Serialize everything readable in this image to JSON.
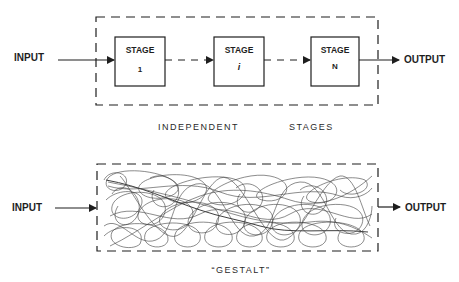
{
  "top_diagram": {
    "input_label": "INPUT",
    "output_label": "OUTPUT",
    "stages": [
      {
        "title": "STAGE",
        "index": "1"
      },
      {
        "title": "STAGE",
        "index": "i"
      },
      {
        "title": "STAGE",
        "index": "N"
      }
    ],
    "caption_left": "INDEPENDENT",
    "caption_right": "STAGES"
  },
  "bottom_diagram": {
    "input_label": "INPUT",
    "output_label": "OUTPUT",
    "caption": "“GESTALT”"
  },
  "colors": {
    "ink": "#1e1e1e",
    "background": "#ffffff"
  }
}
